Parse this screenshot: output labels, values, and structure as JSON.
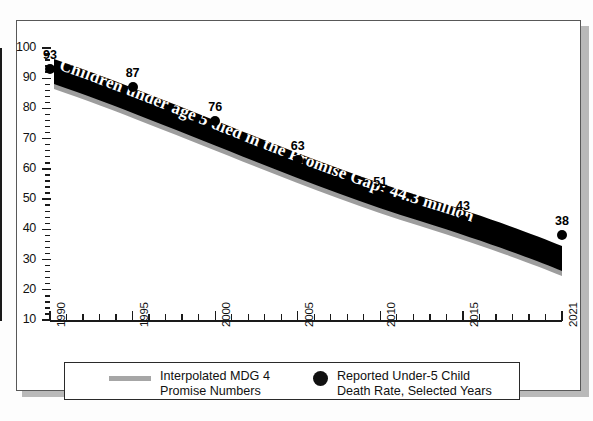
{
  "chart_data": {
    "type": "line",
    "title": "",
    "subtitle": "",
    "xlabel": "",
    "ylabel": "",
    "xlim": [
      1990,
      2021
    ],
    "ylim": [
      10,
      100
    ],
    "grid": false,
    "legend_position": "bottom",
    "y_ticks": [
      100,
      90,
      80,
      70,
      60,
      50,
      40,
      30,
      20,
      10
    ],
    "y_tick_labels": [
      "100",
      "90",
      "80",
      "70",
      "60",
      "50",
      "40",
      "30",
      "20",
      "10"
    ],
    "x_ticks": [
      1990,
      1995,
      2000,
      2005,
      2010,
      2015,
      2021
    ],
    "x_tick_labels": [
      "1990",
      "1995",
      "2000",
      "2005",
      "2010",
      "2015",
      "2021"
    ],
    "annotation": "Children under age 5 died in the Promise Gap: 44.3 million",
    "series": [
      {
        "name": "Interpolated MDG 4 Promise Numbers",
        "type": "band",
        "x": [
          1990,
          1995,
          2000,
          2005,
          2010,
          2015,
          2021
        ],
        "values": [
          93,
          83,
          72,
          62,
          52,
          43,
          33
        ]
      },
      {
        "name": "Reported Under-5 Child Death Rate, Selected Years",
        "type": "scatter",
        "x": [
          1990,
          1995,
          2000,
          2005,
          2010,
          2015,
          2021
        ],
        "values": [
          93,
          87,
          76,
          63,
          51,
          43,
          38
        ],
        "labels": [
          "93",
          "87",
          "76",
          "63",
          "51",
          "43",
          "38"
        ]
      }
    ]
  },
  "legend": {
    "items": [
      {
        "marker": "line-swatch",
        "line1": "Interpolated MDG 4",
        "line2": "Promise Numbers",
        "color": "#a6a6a6"
      },
      {
        "marker": "dot-swatch",
        "line1": "Reported Under-5 Child",
        "line2": "Death Rate, Selected Years",
        "color": "#111111"
      }
    ]
  },
  "colors": {
    "axis": "#1a1a1a",
    "ribbon": "#000000",
    "ribbon_shadow": "#9d9d9d",
    "dot": "#000000",
    "frame": "#585858",
    "background": "#ffffff"
  }
}
